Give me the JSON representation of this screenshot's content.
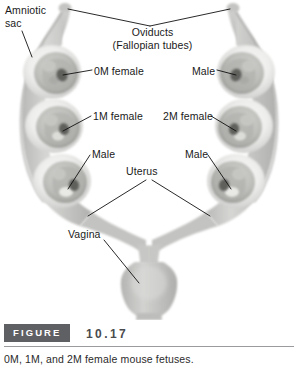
{
  "figure": {
    "badge_label": "FIGURE",
    "number": "10.17",
    "caption": "0M, 1M, and 2M female mouse fetuses."
  },
  "labels": {
    "amniotic_sac": "Amniotic sac",
    "oviducts_line1": "Oviducts",
    "oviducts_line2": "(Fallopian tubes)",
    "zero_m_female": "0M female",
    "one_m_female": "1M female",
    "two_m_female": "2M female",
    "male_top_right": "Male",
    "male_bottom_left": "Male",
    "male_bottom_right": "Male",
    "uterus": "Uterus",
    "vagina": "Vagina"
  },
  "colors": {
    "tissue_light": "#e8e8e6",
    "tissue_mid": "#c9c9c7",
    "tissue_dark": "#a9a9a7",
    "fetus_shadow": "#6f6f6e",
    "leader_line": "#111111",
    "badge_background": "#5f6063",
    "badge_text": "#ffffff",
    "number_text": "#4a4b4e",
    "rule": "#9a9b9e"
  }
}
